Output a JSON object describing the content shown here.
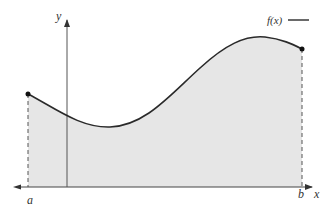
{
  "diagram": {
    "type": "definite-integral-area",
    "labels": {
      "y_axis": "y",
      "x_axis": "x",
      "a": "a",
      "b": "b",
      "legend": "f(x)"
    },
    "colors": {
      "curve": "#2a2a2a",
      "fill": "#e6e6e6",
      "axis": "#444444",
      "dashed": "#555555",
      "point": "#111111"
    },
    "points": {
      "start": {
        "x": 28,
        "y": 94,
        "label": "f(a)"
      },
      "end": {
        "x": 302,
        "y": 49,
        "label": "f(b)"
      }
    },
    "curve_path": "M28,94 C55,108 80,128 110,127 C145,126 170,95 200,68 C225,45 245,35 265,37 C282,39 292,44 302,49"
  }
}
